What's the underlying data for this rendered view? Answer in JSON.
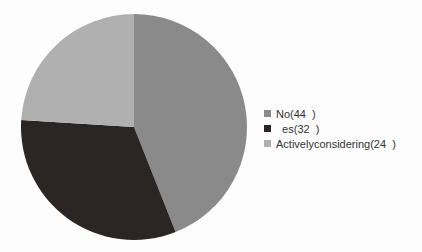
{
  "chart_data": {
    "type": "pie",
    "title": "",
    "categories": [
      "No",
      "Yes",
      "Actively considering"
    ],
    "values": [
      44,
      32,
      24
    ],
    "unit": "%",
    "colors": [
      "#8a8a8a",
      "#2b2624",
      "#b0b0b0"
    ],
    "start_angle_deg": 0,
    "direction": "clockwise",
    "legend_position": "right"
  },
  "legend": {
    "items": [
      {
        "label": "No(44  )",
        "color": "#8a8a8a"
      },
      {
        "label": "  es(32  )",
        "color": "#2b2624"
      },
      {
        "label": "Activelyconsidering(24  )",
        "color": "#b0b0b0"
      }
    ]
  }
}
